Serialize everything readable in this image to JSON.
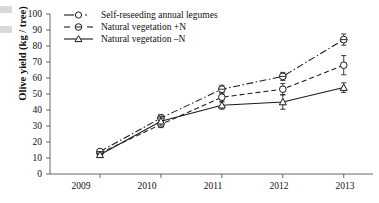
{
  "chart_data": {
    "type": "line",
    "title": "",
    "xlabel": "",
    "ylabel": "Olive yield (kg / tree)",
    "categories": [
      "2009",
      "2010",
      "2011",
      "2012",
      "2013"
    ],
    "x_tick_labels": [
      "2009",
      "2010",
      "2011",
      "2012",
      "2013"
    ],
    "y_tick_labels": [
      "0",
      "10",
      "20",
      "30",
      "40",
      "50",
      "60",
      "70",
      "80",
      "90",
      "100"
    ],
    "ylim": [
      0,
      100
    ],
    "ytick_step": 10,
    "grid": false,
    "legend_position": "top-left-inside",
    "series": [
      {
        "name": "Self-reseeding annual legumes",
        "marker": "open-circle",
        "line_style": "dashed",
        "color": "#1a1a1a",
        "values": [
          13,
          31,
          48,
          53,
          68
        ],
        "error": [
          1.2,
          2.0,
          3.0,
          3.5,
          6.0
        ]
      },
      {
        "name": "Natural vegetation +N",
        "marker": "circle-with-dash",
        "line_style": "dash-dot",
        "color": "#1a1a1a",
        "values": [
          14,
          35,
          53,
          61,
          84
        ],
        "error": [
          1.2,
          2.2,
          2.5,
          2.5,
          3.5
        ]
      },
      {
        "name": "Natural vegetation –N",
        "marker": "open-triangle",
        "line_style": "solid",
        "color": "#1a1a1a",
        "values": [
          12,
          33,
          43,
          45,
          54
        ],
        "error": [
          1.0,
          3.0,
          2.5,
          4.5,
          3.0
        ]
      }
    ]
  },
  "legend": {
    "items": [
      {
        "label": "Self-reseeding annual legumes"
      },
      {
        "label": "Natural vegetation +N"
      },
      {
        "label": "Natural vegetation –N"
      }
    ]
  },
  "axes": {
    "y_title": "Olive yield (kg / tree)",
    "y_ticks": [
      "100",
      "90",
      "80",
      "70",
      "60",
      "50",
      "40",
      "30",
      "20",
      "10",
      "0"
    ],
    "x_ticks": [
      "2009",
      "2010",
      "2011",
      "2012",
      "2013"
    ]
  },
  "colors": {
    "ink": "#1a1a1a",
    "axis": "#555555",
    "background": "#ffffff"
  }
}
